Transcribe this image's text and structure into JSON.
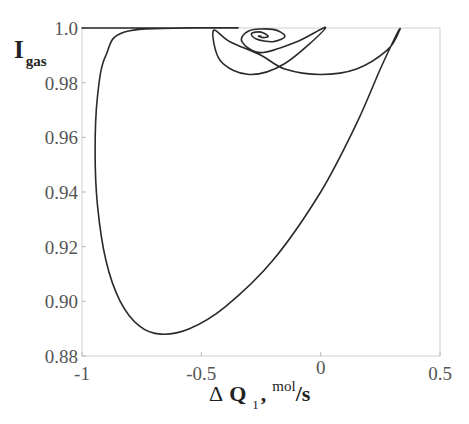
{
  "chart_data": {
    "type": "line",
    "title": "",
    "xlabel": "Δ Q 1 , mol/s",
    "ylabel": "I gas",
    "xlim": [
      -1,
      0.5
    ],
    "ylim": [
      0.88,
      1.0
    ],
    "grid": false,
    "legend": null,
    "x_ticks": [
      "-1",
      "-0.5",
      "0",
      "0.5"
    ],
    "y_ticks": [
      "0.88",
      "0.90",
      "0.92",
      "0.94",
      "0.96",
      "0.98",
      "1.0"
    ],
    "series": [
      {
        "name": "phase trajectory",
        "x": [
          -1.0,
          -0.6,
          -0.35,
          -0.8,
          -0.9,
          -0.935,
          -0.945,
          -0.935,
          -0.9,
          -0.84,
          -0.76,
          -0.67,
          -0.55,
          -0.4,
          -0.2,
          0.0,
          0.15,
          0.25,
          0.32,
          0.33,
          0.28,
          0.15,
          0.0,
          -0.15,
          -0.25,
          -0.38,
          -0.45,
          -0.42,
          -0.3,
          -0.15,
          0.02,
          -0.1,
          -0.25,
          -0.33,
          -0.3,
          -0.2,
          -0.15,
          -0.2,
          -0.27,
          -0.29,
          -0.25,
          -0.22,
          -0.24,
          -0.26,
          -0.25
        ],
        "y": [
          1.0,
          1.0,
          1.0,
          0.999,
          0.99,
          0.975,
          0.955,
          0.935,
          0.915,
          0.9,
          0.891,
          0.888,
          0.89,
          0.898,
          0.915,
          0.94,
          0.965,
          0.985,
          0.998,
          0.999,
          0.992,
          0.985,
          0.983,
          0.985,
          0.99,
          0.995,
          0.999,
          0.988,
          0.983,
          0.987,
          1.0,
          0.995,
          0.991,
          0.995,
          0.999,
          0.9995,
          0.997,
          0.995,
          0.996,
          0.998,
          0.9985,
          0.997,
          0.9965,
          0.997,
          0.997
        ]
      }
    ]
  },
  "axes": {
    "y_label_main": "I",
    "y_label_sub": "gas",
    "x_label_delta": "Δ",
    "x_label_main": "Q",
    "x_label_sub": "1",
    "x_label_comma": ",",
    "x_label_unit_sup": "mol",
    "x_label_unit": "/s"
  }
}
